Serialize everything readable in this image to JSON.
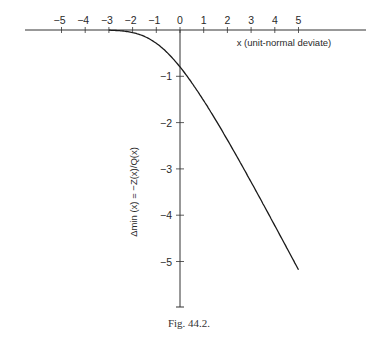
{
  "chart_data": {
    "type": "line",
    "title": "",
    "caption": "Fig. 44.2.",
    "xlabel": "x (unit-normal deviate)",
    "ylabel": "Δmin (x) = −Z(x)/Q(x)",
    "x_ticks": [
      -5,
      -4,
      -3,
      -2,
      -1,
      0,
      1,
      2,
      3,
      4,
      5
    ],
    "x_tick_labels": [
      "−5",
      "−4",
      "−3",
      "−2",
      "−1",
      "0",
      "1",
      "2",
      "3",
      "4",
      "5"
    ],
    "y_ticks": [
      -1,
      -2,
      -3,
      -4,
      -5
    ],
    "y_tick_labels": [
      "−1",
      "−2",
      "−3",
      "−4",
      "−5"
    ],
    "xlim": [
      -6,
      7.5
    ],
    "ylim": [
      -6,
      0
    ],
    "grid": false,
    "legend": null,
    "series": [
      {
        "name": "Δmin(x)",
        "x": [
          -3,
          -2.5,
          -2,
          -1.5,
          -1,
          -0.5,
          0,
          0.5,
          1,
          1.5,
          2,
          2.5,
          3,
          3.5,
          4,
          4.5,
          5
        ],
        "values": [
          -0.004,
          -0.018,
          -0.055,
          -0.147,
          -0.288,
          -0.509,
          -0.798,
          -1.141,
          -1.525,
          -1.939,
          -2.373,
          -2.822,
          -3.283,
          -3.753,
          -4.226,
          -4.705,
          -5.186
        ]
      }
    ]
  },
  "figure": {
    "caption": "Fig. 44.2."
  }
}
